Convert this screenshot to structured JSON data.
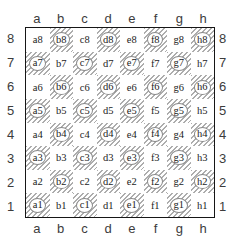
{
  "board": {
    "files": [
      "a",
      "b",
      "c",
      "d",
      "e",
      "f",
      "g",
      "h"
    ],
    "ranks": [
      "8",
      "7",
      "6",
      "5",
      "4",
      "3",
      "2",
      "1"
    ],
    "squares": [
      {
        "label": "a8",
        "dark": false,
        "circled": false
      },
      {
        "label": "b8",
        "dark": true,
        "circled": true
      },
      {
        "label": "c8",
        "dark": false,
        "circled": false
      },
      {
        "label": "d8",
        "dark": true,
        "circled": true
      },
      {
        "label": "e8",
        "dark": false,
        "circled": false
      },
      {
        "label": "f8",
        "dark": true,
        "circled": true
      },
      {
        "label": "g8",
        "dark": false,
        "circled": false
      },
      {
        "label": "h8",
        "dark": true,
        "circled": true
      },
      {
        "label": "a7",
        "dark": true,
        "circled": true
      },
      {
        "label": "b7",
        "dark": false,
        "circled": false
      },
      {
        "label": "c7",
        "dark": true,
        "circled": true
      },
      {
        "label": "d7",
        "dark": false,
        "circled": false
      },
      {
        "label": "e7",
        "dark": true,
        "circled": true
      },
      {
        "label": "f7",
        "dark": false,
        "circled": false
      },
      {
        "label": "g7",
        "dark": true,
        "circled": true
      },
      {
        "label": "h7",
        "dark": false,
        "circled": false
      },
      {
        "label": "a6",
        "dark": false,
        "circled": false
      },
      {
        "label": "b6",
        "dark": true,
        "circled": true
      },
      {
        "label": "c6",
        "dark": false,
        "circled": false
      },
      {
        "label": "d6",
        "dark": true,
        "circled": true
      },
      {
        "label": "e6",
        "dark": false,
        "circled": false
      },
      {
        "label": "f6",
        "dark": true,
        "circled": true
      },
      {
        "label": "g6",
        "dark": false,
        "circled": false
      },
      {
        "label": "h6",
        "dark": true,
        "circled": true
      },
      {
        "label": "a5",
        "dark": true,
        "circled": true
      },
      {
        "label": "b5",
        "dark": false,
        "circled": false
      },
      {
        "label": "c5",
        "dark": true,
        "circled": true
      },
      {
        "label": "d5",
        "dark": false,
        "circled": false
      },
      {
        "label": "e5",
        "dark": true,
        "circled": true
      },
      {
        "label": "f5",
        "dark": false,
        "circled": false
      },
      {
        "label": "g5",
        "dark": true,
        "circled": true
      },
      {
        "label": "h5",
        "dark": false,
        "circled": false
      },
      {
        "label": "a4",
        "dark": false,
        "circled": false
      },
      {
        "label": "b4",
        "dark": true,
        "circled": true
      },
      {
        "label": "c4",
        "dark": false,
        "circled": false
      },
      {
        "label": "d4",
        "dark": true,
        "circled": true
      },
      {
        "label": "e4",
        "dark": false,
        "circled": false
      },
      {
        "label": "f4",
        "dark": true,
        "circled": true
      },
      {
        "label": "g4",
        "dark": false,
        "circled": false
      },
      {
        "label": "h4",
        "dark": true,
        "circled": true
      },
      {
        "label": "a3",
        "dark": true,
        "circled": true
      },
      {
        "label": "b3",
        "dark": false,
        "circled": false
      },
      {
        "label": "c3",
        "dark": true,
        "circled": true
      },
      {
        "label": "d3",
        "dark": false,
        "circled": false
      },
      {
        "label": "e3",
        "dark": true,
        "circled": true
      },
      {
        "label": "f3",
        "dark": false,
        "circled": false
      },
      {
        "label": "g3",
        "dark": true,
        "circled": true
      },
      {
        "label": "h3",
        "dark": false,
        "circled": false
      },
      {
        "label": "a2",
        "dark": false,
        "circled": false
      },
      {
        "label": "b2",
        "dark": true,
        "circled": true
      },
      {
        "label": "c2",
        "dark": false,
        "circled": false
      },
      {
        "label": "d2",
        "dark": true,
        "circled": true
      },
      {
        "label": "e2",
        "dark": false,
        "circled": false
      },
      {
        "label": "f2",
        "dark": true,
        "circled": true
      },
      {
        "label": "g2",
        "dark": false,
        "circled": false
      },
      {
        "label": "h2",
        "dark": true,
        "circled": true
      },
      {
        "label": "a1",
        "dark": true,
        "circled": true
      },
      {
        "label": "b1",
        "dark": false,
        "circled": false
      },
      {
        "label": "c1",
        "dark": true,
        "circled": true
      },
      {
        "label": "d1",
        "dark": false,
        "circled": false
      },
      {
        "label": "e1",
        "dark": true,
        "circled": true
      },
      {
        "label": "f1",
        "dark": false,
        "circled": false
      },
      {
        "label": "g1",
        "dark": true,
        "circled": true
      },
      {
        "label": "h1",
        "dark": false,
        "circled": false
      }
    ],
    "colors": {
      "light_square": "#ffffff",
      "hatch_line": "#adadad",
      "board_border": "#161616",
      "square_label_text": "#1c1c1c",
      "coord_label_text": "#3c3c3c",
      "circle_stroke": "#8a8a8a",
      "circle_fill": "#ffffff"
    }
  }
}
